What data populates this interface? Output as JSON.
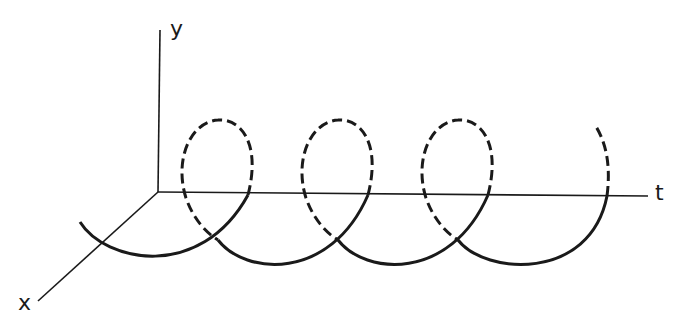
{
  "diagram": {
    "title": "",
    "axes": {
      "y_label": "y",
      "x_label": "x",
      "t_label": "t"
    },
    "colors": {
      "stroke": "#1a1a1a",
      "background": "#ffffff"
    },
    "helix": {
      "turns_visible": 4,
      "front_style": "solid",
      "back_style": "dashed"
    }
  }
}
